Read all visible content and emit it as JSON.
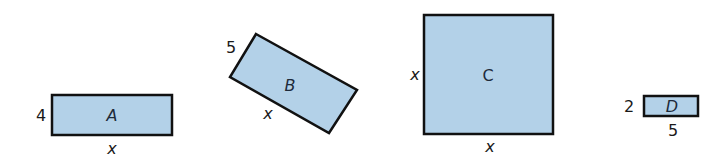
{
  "figure": {
    "fill_color": "#b3d1e8",
    "stroke_color": "#111111",
    "shapes": [
      {
        "id": "A",
        "label": "A",
        "type": "rectangle",
        "side_label": "4",
        "bottom_label": "x"
      },
      {
        "id": "B",
        "label": "B",
        "type": "rotated-rectangle",
        "side_label": "5",
        "bottom_label": "x"
      },
      {
        "id": "C",
        "label": "C",
        "type": "square",
        "side_label": "x",
        "bottom_label": "x"
      },
      {
        "id": "D",
        "label": "D",
        "type": "rectangle",
        "side_label": "2",
        "bottom_label": "5"
      }
    ]
  }
}
